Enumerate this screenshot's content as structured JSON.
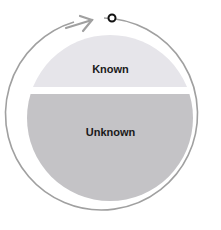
{
  "diagram": {
    "regions": [
      {
        "label": "Known",
        "color": "#e6e5ea"
      },
      {
        "label": "Unknown",
        "color": "#c4c3c6"
      }
    ],
    "cycle_arrow_color": "#a0a0a0",
    "start_marker_color": "#111111"
  }
}
